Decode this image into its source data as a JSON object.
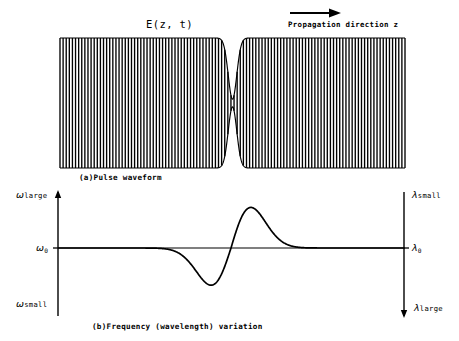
{
  "figure": {
    "title": "E(z, t)",
    "propagation_label": "Propagation direction z",
    "propagation_arrow_icon": "right-arrow-icon",
    "caption_a": "(a)Pulse waveform",
    "caption_b": "(b)Frequency (wavelength) variation",
    "background_color": "#ffffff",
    "line_color": "#000000"
  },
  "axes": {
    "left": {
      "top_label_symbol": "ω",
      "top_label_text": "large",
      "mid_label_symbol": "ω",
      "mid_label_sub": "0",
      "bottom_label_symbol": "ω",
      "bottom_label_text": "small"
    },
    "right": {
      "top_label_symbol": "λ",
      "top_label_text": "small",
      "mid_label_symbol": "λ",
      "mid_label_sub": "0",
      "bottom_label_symbol": "λ",
      "bottom_label_text": "large"
    }
  },
  "chart_data": [
    {
      "type": "line",
      "name": "pulse-waveform",
      "title": "E(z, t)",
      "xlabel": "Propagation direction z",
      "ylabel": "E(z, t)",
      "description": "Chirped pulse waveform: carrier oscillations under an hourglass envelope pinched at the centre",
      "grid": false,
      "legend": null,
      "plot_box": {
        "x0": 60,
        "x1": 405,
        "y_top": 38,
        "y_bottom": 168,
        "y_mid": 103
      },
      "xlim": [
        -1,
        1
      ],
      "ylim": [
        -1,
        1
      ],
      "carrier_cycles": 55,
      "envelope": {
        "kind": "hourglass-waist",
        "waist_x": 0.0,
        "waist_half_width": 0.035,
        "edge_amplitude": 1.0,
        "waist_amplitude": 0.06,
        "shape": "plateau-1-minus-gaussian"
      },
      "samples": 1400
    },
    {
      "type": "line",
      "name": "frequency-variation",
      "title": "(b)Frequency (wavelength) variation",
      "xlabel": "z",
      "ylabel": "ω",
      "description": "Instantaneous frequency chirp: negative dip before the centre, positive peak after, returning to omega-zero at both ends",
      "grid": false,
      "legend": null,
      "plot_box": {
        "x0": 58,
        "x1": 404,
        "y_top": 196,
        "y_bottom": 308,
        "y_mid": 248
      },
      "xlim": [
        -1,
        1
      ],
      "ylim": [
        -1,
        1
      ],
      "baseline_value": 0,
      "zero_crossing_x": 0.0,
      "trough": {
        "x": -0.115,
        "y": -0.62
      },
      "peak": {
        "x": 0.105,
        "y": 0.78
      },
      "curve_form": "derivative-of-gaussian",
      "sigma": 0.115,
      "samples": 900,
      "axis_arrows": {
        "left_up": true,
        "right_down": true
      },
      "tick_marks": {
        "left_mid": true,
        "right_mid": true
      }
    }
  ]
}
